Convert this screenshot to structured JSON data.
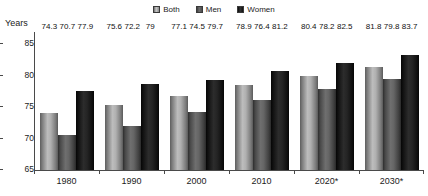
{
  "axis_title": "Years",
  "legend": {
    "items": [
      {
        "label": "Both",
        "key": "both",
        "color": "#b0b0b0",
        "icon": "legend-swatch-icon"
      },
      {
        "label": "Men",
        "key": "men",
        "color": "#636363",
        "icon": "legend-swatch-icon"
      },
      {
        "label": "Women",
        "key": "women",
        "color": "#121212",
        "icon": "legend-swatch-icon"
      }
    ]
  },
  "yticks": [
    "85",
    "80",
    "75",
    "70",
    "65"
  ],
  "xticks": [
    "1980",
    "1990",
    "2000",
    "2010",
    "2020*",
    "2030*"
  ],
  "values": {
    "g0": {
      "both": "74.3",
      "men": "70.7",
      "women": "77.9"
    },
    "g1": {
      "both": "75.6",
      "men": "72.2",
      "women": "79"
    },
    "g2": {
      "both": "77.1",
      "men": "74.5",
      "women": "79.7"
    },
    "g3": {
      "both": "78.9",
      "men": "76.4",
      "women": "81.2"
    },
    "g4": {
      "both": "80.4",
      "men": "78.2",
      "women": "82.5"
    },
    "g5": {
      "both": "81.8",
      "men": "79.8",
      "women": "83.7"
    }
  },
  "chart_data": {
    "type": "bar",
    "title": "",
    "subtitle": "",
    "xlabel": "",
    "ylabel": "Years",
    "categories": [
      "1980",
      "1990",
      "2000",
      "2010",
      "2020*",
      "2030*"
    ],
    "series": [
      {
        "name": "Both",
        "values": [
          74.3,
          75.6,
          77.1,
          78.9,
          80.4,
          81.8
        ],
        "color": "#b0b0b0"
      },
      {
        "name": "Men",
        "values": [
          70.7,
          72.2,
          74.5,
          76.4,
          78.2,
          79.8
        ],
        "color": "#636363"
      },
      {
        "name": "Women",
        "values": [
          77.9,
          79.0,
          79.7,
          81.2,
          82.5,
          83.7
        ],
        "color": "#121212"
      }
    ],
    "ylim": [
      65,
      87.5
    ],
    "ytick_values": [
      65,
      70,
      75,
      80,
      85
    ],
    "grid": false,
    "legend_position": "top-center",
    "data_labels": true,
    "note": "asterisk on 2020 and 2030 denotes projected values"
  }
}
